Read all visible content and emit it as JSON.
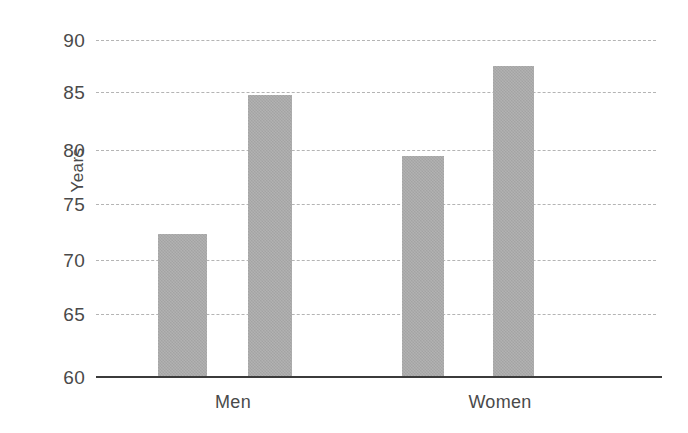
{
  "chart_data": {
    "type": "bar",
    "title": "",
    "subtitle": "",
    "xlabel": "",
    "ylabel": "Years",
    "categories": [
      "Men",
      "Women"
    ],
    "series": [
      {
        "name": "Series 1",
        "values": [
          72.7,
          79.6
        ]
      },
      {
        "name": "Series 2",
        "values": [
          85.1,
          87.7
        ]
      }
    ],
    "bars": [
      {
        "group": "Men",
        "series": "Series 1",
        "value": 72.7
      },
      {
        "group": "Men",
        "series": "Series 2",
        "value": 85.1
      },
      {
        "group": "Women",
        "series": "Series 1",
        "value": 79.6
      },
      {
        "group": "Women",
        "series": "Series 2",
        "value": 87.7
      }
    ],
    "ylim": [
      60,
      90
    ],
    "ytick_step": 5,
    "ytick_labels": [
      "90",
      "85",
      "80",
      "75",
      "70",
      "65",
      "60"
    ],
    "ytick_values": [
      90,
      85,
      80,
      75,
      70,
      65,
      60
    ],
    "grid": "horizontal-dashed",
    "grid_color": "#b4b4b4",
    "axis_color": "#3b3b3b",
    "bar_color": "#a9a9a9",
    "legend": "none",
    "legend_position": "none",
    "annotations": []
  },
  "axis": {
    "y_title": "Years",
    "ticks": [
      {
        "label": "90",
        "value": 90
      },
      {
        "label": "85",
        "value": 85
      },
      {
        "label": "80",
        "value": 80
      },
      {
        "label": "75",
        "value": 75
      },
      {
        "label": "70",
        "value": 70
      },
      {
        "label": "65",
        "value": 65
      },
      {
        "label": "60",
        "value": 60
      }
    ]
  },
  "categories": [
    {
      "label": "Men"
    },
    {
      "label": "Women"
    }
  ]
}
